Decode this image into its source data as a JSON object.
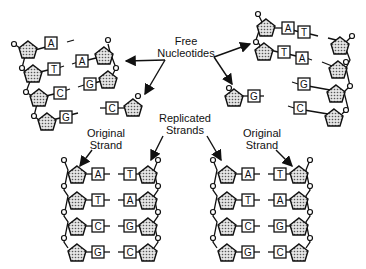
{
  "diagram": {
    "labels": {
      "free_nucleotides": [
        "Free",
        "Nucleotides"
      ],
      "replicated_strands": [
        "Replicated",
        "Strands"
      ],
      "original_strand_left": [
        "Original",
        "Strand"
      ],
      "original_strand_right": [
        "Original",
        "Strand"
      ]
    },
    "top_left_unzipping": {
      "backbone_strand_bases": [
        "A",
        "T",
        "C",
        "G"
      ],
      "paired_bases": [
        "A",
        "G"
      ],
      "free_nucleotide": "C"
    },
    "top_right_unzipping": {
      "paired_rows": [
        [
          "A",
          "T"
        ],
        [
          "T",
          "A"
        ]
      ],
      "backbone_strand_bases": [
        "T",
        "A",
        "G",
        "C"
      ],
      "free_nucleotide": "G"
    },
    "bottom_left_double_helix": {
      "left_strand_label": "Original Strand",
      "pairs": [
        [
          "A",
          "T"
        ],
        [
          "T",
          "A"
        ],
        [
          "C",
          "G"
        ],
        [
          "G",
          "C"
        ]
      ]
    },
    "bottom_right_double_helix": {
      "right_strand_label": "Original Strand",
      "pairs": [
        [
          "A",
          "T"
        ],
        [
          "T",
          "A"
        ],
        [
          "C",
          "G"
        ],
        [
          "G",
          "C"
        ]
      ]
    },
    "colors": {
      "ink": "#111111",
      "sugar_fill": "#bdbdbd",
      "background": "#ffffff"
    }
  }
}
